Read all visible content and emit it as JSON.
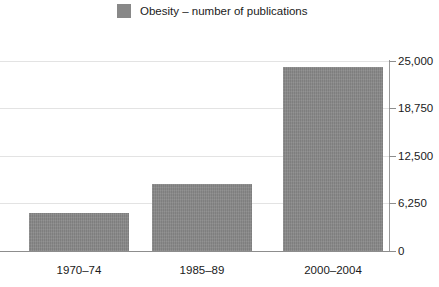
{
  "legend": {
    "swatch_name": "legend-color-swatch",
    "label": "Obesity – number of publications",
    "color": "#888888"
  },
  "axis": {
    "y_ticks": [
      "0",
      "6,250",
      "12,500",
      "18,750",
      "25,000"
    ],
    "x_ticks": [
      "1970–74",
      "1985–89",
      "2000–2004"
    ]
  },
  "chart_data": {
    "type": "bar",
    "title": "",
    "subtitle": "",
    "xlabel": "",
    "ylabel": "",
    "categories": [
      "1970–74",
      "1985–89",
      "2000–2004"
    ],
    "series": [
      {
        "name": "Obesity – number of publications",
        "color": "#888888",
        "values": [
          5050,
          8800,
          24200
        ]
      }
    ],
    "ylim": [
      0,
      25000
    ],
    "yticks": [
      0,
      6250,
      12500,
      18750,
      25000
    ],
    "ytick_labels": [
      "0",
      "6,250",
      "12,500",
      "18,750",
      "25,000"
    ],
    "grid": true,
    "grid_axis": "y",
    "legend": true,
    "legend_position": "top-center",
    "annotations": []
  }
}
